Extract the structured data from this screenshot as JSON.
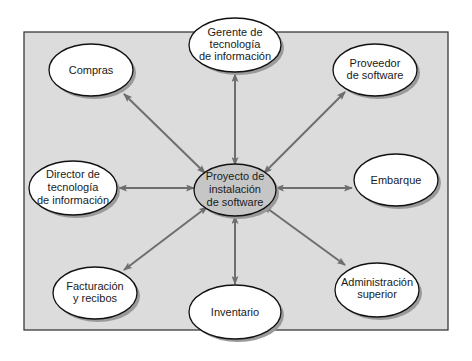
{
  "diagram": {
    "type": "stakeholder-hub",
    "colors": {
      "background": "#ffffff",
      "panel_fill": "#dcdcdc",
      "panel_border": "#3a3a3a",
      "node_fill": "#ffffff",
      "center_fill": "#c6c6c6",
      "node_border": "#111111",
      "shadow": "#9a9a9a",
      "arrow": "#6e6e6e"
    },
    "center": {
      "id": "proyecto",
      "lines": [
        "Proyecto de",
        "instalación",
        "de software"
      ]
    },
    "nodes": [
      {
        "id": "gerente",
        "lines": [
          "Gerente de",
          "tecnología",
          "de información"
        ]
      },
      {
        "id": "compras",
        "lines": [
          "Compras"
        ]
      },
      {
        "id": "proveedor",
        "lines": [
          "Proveedor",
          "de software"
        ]
      },
      {
        "id": "director",
        "lines": [
          "Director de",
          "tecnología",
          "de información"
        ]
      },
      {
        "id": "embarque",
        "lines": [
          "Embarque"
        ]
      },
      {
        "id": "facturacion",
        "lines": [
          "Facturación",
          "y recibos"
        ]
      },
      {
        "id": "inventario",
        "lines": [
          "Inventario"
        ]
      },
      {
        "id": "administracion",
        "lines": [
          "Administración",
          "superior"
        ]
      }
    ],
    "edges": [
      {
        "from": "proyecto",
        "to": "gerente",
        "bidirectional": true
      },
      {
        "from": "proyecto",
        "to": "compras",
        "bidirectional": true
      },
      {
        "from": "proyecto",
        "to": "proveedor",
        "bidirectional": true
      },
      {
        "from": "proyecto",
        "to": "director",
        "bidirectional": true
      },
      {
        "from": "proyecto",
        "to": "embarque",
        "bidirectional": true
      },
      {
        "from": "proyecto",
        "to": "facturacion",
        "bidirectional": true
      },
      {
        "from": "proyecto",
        "to": "inventario",
        "bidirectional": true
      },
      {
        "from": "proyecto",
        "to": "administracion",
        "bidirectional": true
      }
    ]
  }
}
